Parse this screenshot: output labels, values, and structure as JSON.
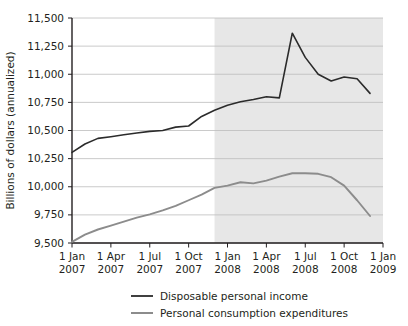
{
  "chart_data": {
    "type": "line",
    "title": "",
    "subtitle": "",
    "xlabel": "",
    "ylabel": "Billions of dollars (annualized)",
    "ylim": [
      9500,
      11500
    ],
    "yticks": [
      9500,
      9750,
      10000,
      10250,
      10500,
      10750,
      11000,
      11250,
      11500
    ],
    "ytick_labels": [
      "9,500",
      "9,750",
      "10,000",
      "10,250",
      "10,500",
      "10,750",
      "11,000",
      "11,250",
      "11,500"
    ],
    "xtick_labels": [
      {
        "line1": "1 Jan",
        "line2": "2007"
      },
      {
        "line1": "1 Apr",
        "line2": "2007"
      },
      {
        "line1": "1 Jul",
        "line2": "2007"
      },
      {
        "line1": "1 Oct",
        "line2": "2007"
      },
      {
        "line1": "1 Jan",
        "line2": "2008"
      },
      {
        "line1": "1 Apr",
        "line2": "2008"
      },
      {
        "line1": "1 Jul",
        "line2": "2008"
      },
      {
        "line1": "1 Oct",
        "line2": "2008"
      },
      {
        "line1": "1 Jan",
        "line2": "2009"
      }
    ],
    "x": [
      "2007-01",
      "2007-02",
      "2007-03",
      "2007-04",
      "2007-05",
      "2007-06",
      "2007-07",
      "2007-08",
      "2007-09",
      "2007-10",
      "2007-11",
      "2007-12",
      "2008-01",
      "2008-02",
      "2008-03",
      "2008-04",
      "2008-05",
      "2008-06",
      "2008-07",
      "2008-08",
      "2008-09",
      "2008-10",
      "2008-11",
      "2008-12"
    ],
    "grid": true,
    "grid_axis": "y",
    "legend_position": "bottom",
    "shaded_region": {
      "label": "recession",
      "from": "2007-12",
      "to": "2009-01",
      "color": "#e7e7e7"
    },
    "series": [
      {
        "name": "Disposable personal income",
        "color": "#2b2b2b",
        "values": [
          10305,
          10380,
          10430,
          10445,
          10462,
          10478,
          10492,
          10500,
          10530,
          10540,
          10625,
          10680,
          10725,
          10755,
          10775,
          10800,
          10790,
          11365,
          11150,
          11000,
          10940,
          10975,
          10960,
          10830
        ]
      },
      {
        "name": "Personal consumption expenditures",
        "color": "#8c8c8c",
        "values": [
          9510,
          9575,
          9620,
          9655,
          9690,
          9725,
          9755,
          9790,
          9830,
          9880,
          9930,
          9990,
          10010,
          10040,
          10030,
          10055,
          10090,
          10120,
          10120,
          10115,
          10085,
          10010,
          9880,
          9740
        ]
      }
    ],
    "legend": [
      {
        "label": "Disposable personal income",
        "color": "#2b2b2b"
      },
      {
        "label": "Personal consumption expenditures",
        "color": "#8c8c8c"
      }
    ]
  }
}
